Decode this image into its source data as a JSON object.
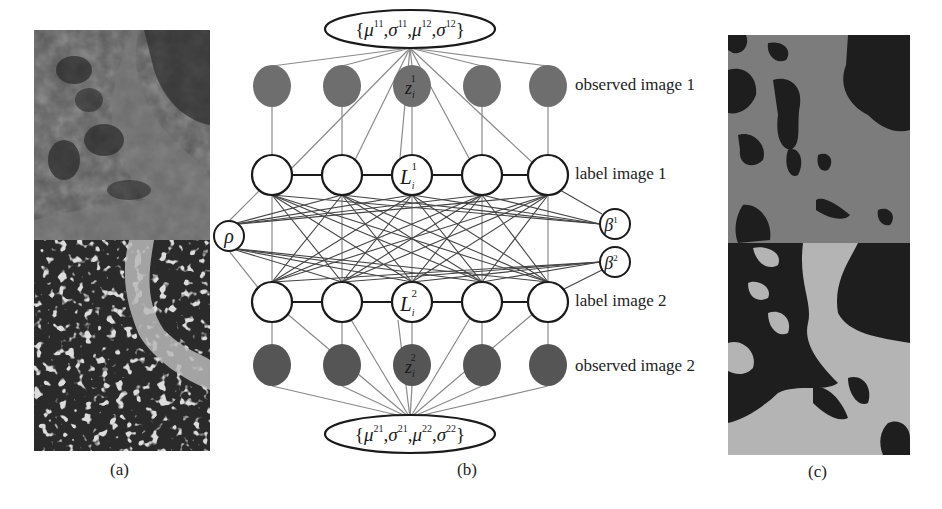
{
  "figure": {
    "panels": [
      {
        "id": "a",
        "caption": "(a)",
        "description": "two observed tissue images stacked vertically"
      },
      {
        "id": "b",
        "caption": "(b)",
        "description": "graphical model"
      },
      {
        "id": "c",
        "caption": "(c)",
        "description": "two label/segmentation images stacked vertically"
      }
    ],
    "model": {
      "top_params": "{μ¹¹,σ¹¹,μ¹²,σ¹²}",
      "top_params_parts": [
        "μ",
        "11",
        "σ",
        "11",
        "μ",
        "12",
        "σ",
        "12"
      ],
      "bottom_params": "{μ²¹,σ²¹,μ²²,σ²²}",
      "bottom_params_parts": [
        "μ",
        "21",
        "σ",
        "21",
        "μ",
        "22",
        "σ",
        "22"
      ],
      "row_labels": {
        "observed1": "observed image 1",
        "label1": "label image 1",
        "label2": "label image 2",
        "observed2": "observed image 2"
      },
      "node_labels": {
        "z1": {
          "base": "z",
          "sub": "i",
          "sup": "1"
        },
        "L1": {
          "base": "L",
          "sub": "i",
          "sup": "1"
        },
        "L2": {
          "base": "L",
          "sub": "i",
          "sup": "2"
        },
        "z2": {
          "base": "z",
          "sub": "i",
          "sup": "2"
        },
        "rho": "ρ",
        "beta1": {
          "base": "β",
          "sup": "1"
        },
        "beta2": {
          "base": "β",
          "sup": "2"
        }
      },
      "nodes_per_row": 5,
      "colors": {
        "observed_fill": "#6e6e6e",
        "label_fill": "#ffffff",
        "edge_gray": "#8a8a8a",
        "edge_dark": "#333333",
        "stroke": "#1a1a1a"
      }
    }
  }
}
